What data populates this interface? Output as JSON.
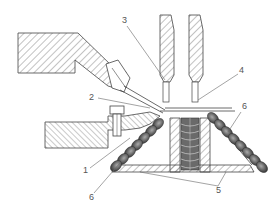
{
  "diagram": {
    "type": "mechanical cross-section",
    "labels": [
      {
        "id": "1",
        "text": "1",
        "x": 85,
        "y": 172
      },
      {
        "id": "2",
        "text": "2",
        "x": 91,
        "y": 99
      },
      {
        "id": "3",
        "text": "3",
        "x": 122,
        "y": 22
      },
      {
        "id": "4",
        "text": "4",
        "x": 240,
        "y": 72
      },
      {
        "id": "5",
        "text": "5",
        "x": 218,
        "y": 191
      },
      {
        "id": "6a",
        "text": "6",
        "x": 243,
        "y": 109
      },
      {
        "id": "6b",
        "text": "6",
        "x": 91,
        "y": 197
      }
    ],
    "colors": {
      "line": "#444444",
      "hatch": "#555555",
      "spring": "#5a5a5a",
      "background": "#ffffff"
    }
  }
}
